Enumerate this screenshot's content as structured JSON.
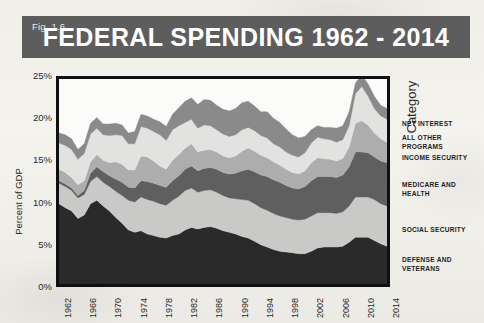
{
  "figure": {
    "fig_label": "Fig. 1.6",
    "title": "FEDERAL SPENDING 1962 - 2014",
    "title_bar_color": "#5d5d5d",
    "page_background": "#f2f1ec"
  },
  "legend": {
    "title": "Category",
    "entries": [
      {
        "label": "NET INTEREST",
        "color": "#8a8a8a",
        "top": 48
      },
      {
        "label": "ALL OTHER PROGRAMS",
        "color": "#e2e2e0",
        "top": 62
      },
      {
        "label": "INCOME SECURITY",
        "color": "#adadad",
        "top": 82
      },
      {
        "label": "MEDICARE AND HEALTH",
        "color": "#5f5f5f",
        "top": 109
      },
      {
        "label": "SOCIAL SECURITY",
        "color": "#c9c9c7",
        "top": 154
      },
      {
        "label": "DEFENSE AND VETERANS",
        "color": "#2a2a2a",
        "top": 184
      }
    ]
  },
  "chart_data": {
    "type": "area",
    "title": "FEDERAL SPENDING 1962 - 2014",
    "xlabel": "",
    "ylabel": "Percent of GDP",
    "ylim": [
      0,
      25
    ],
    "y_ticks": [
      "0%",
      "5%",
      "10%",
      "15%",
      "20%",
      "25%"
    ],
    "y_tick_values": [
      0,
      5,
      10,
      15,
      20,
      25
    ],
    "grid": false,
    "legend_position": "right",
    "stacked": true,
    "x_tick_labels": [
      "1962",
      "1966",
      "1970",
      "1974",
      "1978",
      "1982",
      "1986",
      "1990",
      "1994",
      "1998",
      "2002",
      "2006",
      "2010",
      "2014"
    ],
    "x": [
      1962,
      1963,
      1964,
      1965,
      1966,
      1967,
      1968,
      1969,
      1970,
      1971,
      1972,
      1973,
      1974,
      1975,
      1976,
      1977,
      1978,
      1979,
      1980,
      1981,
      1982,
      1983,
      1984,
      1985,
      1986,
      1987,
      1988,
      1989,
      1990,
      1991,
      1992,
      1993,
      1994,
      1995,
      1996,
      1997,
      1998,
      1999,
      2000,
      2001,
      2002,
      2003,
      2004,
      2005,
      2006,
      2007,
      2008,
      2009,
      2010,
      2011,
      2012,
      2013,
      2014
    ],
    "series": [
      {
        "name": "DEFENSE AND VETERANS",
        "color": "#2a2a2a",
        "values": [
          9.8,
          9.3,
          8.9,
          8.0,
          8.4,
          9.8,
          10.2,
          9.5,
          8.9,
          8.1,
          7.4,
          6.6,
          6.3,
          6.5,
          6.1,
          5.9,
          5.7,
          5.6,
          5.9,
          6.1,
          6.6,
          6.9,
          6.7,
          6.9,
          7.0,
          6.8,
          6.5,
          6.3,
          6.1,
          5.8,
          5.6,
          5.2,
          4.8,
          4.5,
          4.2,
          4.0,
          3.9,
          3.8,
          3.7,
          3.7,
          4.0,
          4.4,
          4.5,
          4.5,
          4.5,
          4.6,
          5.1,
          5.7,
          5.7,
          5.7,
          5.3,
          4.9,
          4.6
        ]
      },
      {
        "name": "SOCIAL SECURITY",
        "color": "#c9c9c7",
        "values": [
          2.5,
          2.6,
          2.5,
          2.5,
          2.5,
          2.7,
          2.9,
          2.9,
          3.0,
          3.2,
          3.4,
          3.6,
          3.7,
          4.1,
          4.2,
          4.2,
          4.1,
          4.0,
          4.3,
          4.6,
          4.8,
          4.8,
          4.5,
          4.5,
          4.5,
          4.4,
          4.3,
          4.2,
          4.3,
          4.5,
          4.6,
          4.6,
          4.5,
          4.5,
          4.4,
          4.3,
          4.2,
          4.1,
          4.1,
          4.2,
          4.3,
          4.3,
          4.2,
          4.2,
          4.1,
          4.2,
          4.4,
          4.9,
          4.9,
          4.9,
          5.0,
          4.9,
          4.9
        ]
      },
      {
        "name": "MEDICARE AND HEALTH",
        "color": "#5f5f5f",
        "values": [
          0.3,
          0.3,
          0.3,
          0.3,
          0.5,
          1.0,
          1.2,
          1.3,
          1.3,
          1.5,
          1.6,
          1.6,
          1.7,
          2.0,
          2.2,
          2.2,
          2.2,
          2.2,
          2.4,
          2.5,
          2.6,
          2.7,
          2.6,
          2.7,
          2.7,
          2.8,
          2.8,
          2.9,
          3.1,
          3.5,
          3.8,
          3.9,
          4.0,
          4.1,
          4.1,
          4.1,
          3.9,
          3.8,
          3.8,
          4.0,
          4.3,
          4.4,
          4.4,
          4.4,
          4.4,
          4.5,
          4.8,
          5.5,
          5.5,
          5.4,
          5.2,
          5.2,
          5.3
        ]
      },
      {
        "name": "INCOME SECURITY",
        "color": "#adadad",
        "values": [
          1.4,
          1.4,
          1.3,
          1.3,
          1.2,
          1.4,
          1.5,
          1.4,
          1.6,
          2.1,
          2.2,
          2.1,
          2.2,
          3.0,
          3.0,
          2.7,
          2.4,
          2.2,
          2.5,
          2.6,
          2.6,
          2.7,
          2.3,
          2.2,
          2.2,
          2.1,
          2.0,
          2.0,
          2.1,
          2.4,
          2.6,
          2.5,
          2.4,
          2.3,
          2.2,
          2.1,
          2.0,
          1.9,
          1.8,
          1.9,
          2.2,
          2.3,
          2.2,
          2.1,
          2.0,
          2.0,
          2.4,
          3.5,
          3.8,
          3.4,
          2.9,
          2.7,
          2.5
        ]
      },
      {
        "name": "ALL OTHER PROGRAMS",
        "color": "#e2e2e0",
        "values": [
          3.2,
          3.3,
          3.4,
          3.1,
          3.3,
          3.4,
          3.2,
          3.1,
          3.3,
          3.3,
          3.5,
          3.2,
          3.2,
          3.6,
          3.5,
          3.6,
          3.8,
          3.5,
          3.7,
          3.5,
          3.1,
          3.0,
          2.9,
          3.1,
          2.9,
          2.7,
          2.7,
          2.6,
          2.6,
          2.6,
          2.5,
          2.5,
          2.4,
          2.4,
          2.2,
          2.2,
          2.1,
          2.1,
          2.1,
          2.2,
          2.4,
          2.5,
          2.4,
          2.4,
          2.3,
          2.3,
          2.6,
          3.6,
          4.2,
          3.5,
          3.0,
          2.8,
          2.8
        ]
      },
      {
        "name": "NET INTEREST",
        "color": "#8a8a8a",
        "values": [
          1.2,
          1.3,
          1.3,
          1.2,
          1.2,
          1.3,
          1.3,
          1.3,
          1.4,
          1.4,
          1.3,
          1.3,
          1.5,
          1.5,
          1.5,
          1.5,
          1.6,
          1.7,
          1.9,
          2.2,
          2.6,
          2.6,
          2.9,
          3.1,
          3.1,
          3.0,
          3.0,
          3.1,
          3.2,
          3.3,
          3.2,
          3.0,
          2.9,
          3.2,
          3.1,
          3.0,
          2.8,
          2.5,
          2.3,
          2.0,
          1.6,
          1.4,
          1.4,
          1.5,
          1.7,
          1.7,
          1.7,
          1.3,
          1.4,
          1.5,
          1.5,
          1.3,
          1.3
        ]
      }
    ]
  }
}
